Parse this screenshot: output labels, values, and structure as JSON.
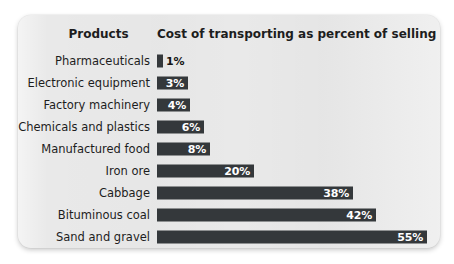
{
  "panel": {
    "background_color": "#e9e9e9",
    "bar_color": "#34383b",
    "label_color": "#1d1d1d",
    "value_color_inside": "#ffffff",
    "value_color_outside": "#141414"
  },
  "headers": {
    "products": "Products",
    "value": "Cost of transporting as percent of selling price"
  },
  "chart_data": {
    "type": "bar",
    "orientation": "horizontal",
    "title": "Cost of transporting as percent of selling price",
    "xlabel": "Cost of transporting as percent of selling price",
    "ylabel": "Products",
    "grid": false,
    "legend": null,
    "xlim": [
      0,
      55
    ],
    "value_suffix": "%",
    "categories": [
      "Pharmaceuticals",
      "Electronic equipment",
      "Factory machinery",
      "Chemicals and plastics",
      "Manufactured food",
      "Iron ore",
      "Cabbage",
      "Bituminous coal",
      "Sand and gravel"
    ],
    "values": [
      1,
      3,
      4,
      6,
      8,
      20,
      38,
      42,
      55
    ],
    "labels": [
      "1%",
      "3%",
      "4%",
      "6%",
      "8%",
      "20%",
      "38%",
      "42%",
      "55%"
    ]
  },
  "rows": [
    {
      "label": "Pharmaceuticals",
      "value": "1%",
      "width_px": 6,
      "label_outside": true
    },
    {
      "label": "Electronic equipment",
      "value": "3%",
      "width_px": 31,
      "label_outside": false
    },
    {
      "label": "Factory machinery",
      "value": "4%",
      "width_px": 33,
      "label_outside": false
    },
    {
      "label": "Chemicals and plastics",
      "value": "6%",
      "width_px": 47,
      "label_outside": false
    },
    {
      "label": "Manufactured food",
      "value": "8%",
      "width_px": 53,
      "label_outside": false
    },
    {
      "label": "Iron ore",
      "value": "20%",
      "width_px": 97,
      "label_outside": false
    },
    {
      "label": "Cabbage",
      "value": "38%",
      "width_px": 196,
      "label_outside": false
    },
    {
      "label": "Bituminous coal",
      "value": "42%",
      "width_px": 219,
      "label_outside": false
    },
    {
      "label": "Sand and gravel",
      "value": "55%",
      "width_px": 270,
      "label_outside": false
    }
  ]
}
